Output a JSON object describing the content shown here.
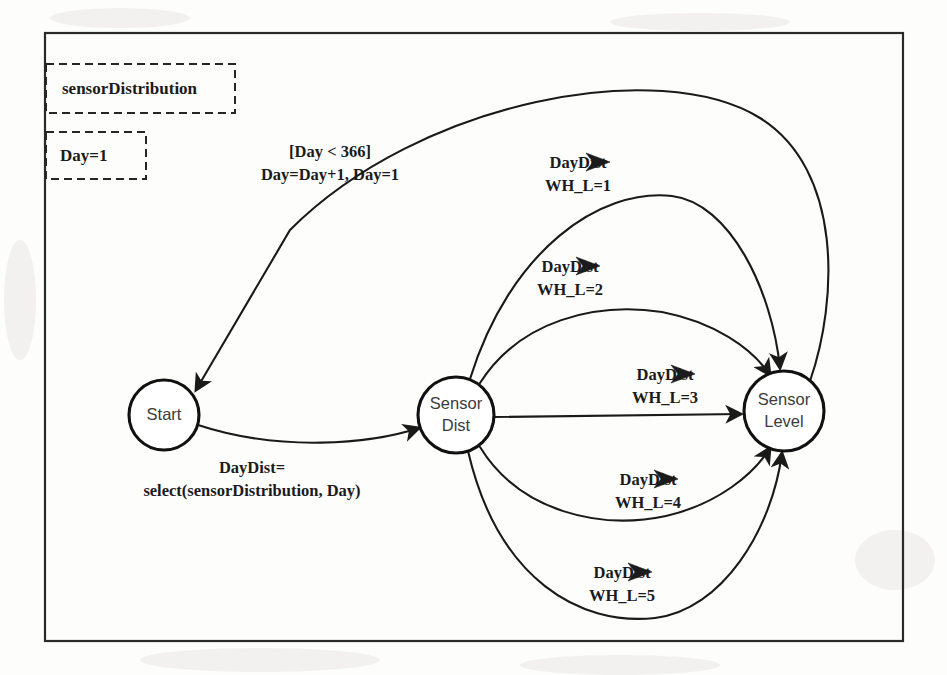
{
  "diagram": {
    "type": "state-machine",
    "title_boxes": [
      {
        "id": "sensor-distribution",
        "label": "sensorDistribution"
      },
      {
        "id": "day-init",
        "label": "Day=1"
      }
    ],
    "nodes": [
      {
        "id": "start",
        "label_line1": "Start",
        "label_line2": "",
        "cx": 164,
        "cy": 415,
        "r": 35
      },
      {
        "id": "sensor-dist",
        "label_line1": "Sensor",
        "label_line2": "Dist",
        "cx": 456,
        "cy": 415,
        "r": 38
      },
      {
        "id": "sensor-level",
        "label_line1": "Sensor",
        "label_line2": "Level",
        "cx": 784,
        "cy": 411,
        "r": 40
      }
    ],
    "edges": [
      {
        "id": "start-to-sensordist",
        "from": "start",
        "to": "sensor-dist",
        "label_line1": "DayDist=",
        "label_line2": "select(sensorDistribution, Day)",
        "has_symbol": false
      },
      {
        "id": "sensorlevel-to-start",
        "from": "sensor-level",
        "to": "start",
        "label_line1": "[Day < 366]",
        "label_line2": "Day=Day+1, Day=1",
        "has_symbol": false
      },
      {
        "id": "sensordist-to-sensorlevel-1",
        "from": "sensor-dist",
        "to": "sensor-level",
        "label_line1": "DayDist",
        "label_line2": "WH_L=1",
        "has_symbol": true,
        "symbol": "arrow-right-glyph"
      },
      {
        "id": "sensordist-to-sensorlevel-2",
        "from": "sensor-dist",
        "to": "sensor-level",
        "label_line1": "DayDist",
        "label_line2": "WH_L=2",
        "has_symbol": true,
        "symbol": "arrow-right-glyph"
      },
      {
        "id": "sensordist-to-sensorlevel-3",
        "from": "sensor-dist",
        "to": "sensor-level",
        "label_line1": "DayDist",
        "label_line2": "WH_L=3",
        "has_symbol": true,
        "symbol": "arrow-right-glyph"
      },
      {
        "id": "sensordist-to-sensorlevel-4",
        "from": "sensor-dist",
        "to": "sensor-level",
        "label_line1": "DayDist",
        "label_line2": "WH_L=4",
        "has_symbol": true,
        "symbol": "arrow-right-glyph"
      },
      {
        "id": "sensordist-to-sensorlevel-5",
        "from": "sensor-dist",
        "to": "sensor-level",
        "label_line1": "DayDist",
        "label_line2": "WH_L=5",
        "has_symbol": true,
        "symbol": "arrow-right-glyph"
      }
    ],
    "colors": {
      "background": "#ffffff",
      "paper": "#fdfdfc",
      "stroke": "#1a1a1a",
      "frame": "#2a2a2a",
      "node_text": "#3b3b3b"
    }
  }
}
